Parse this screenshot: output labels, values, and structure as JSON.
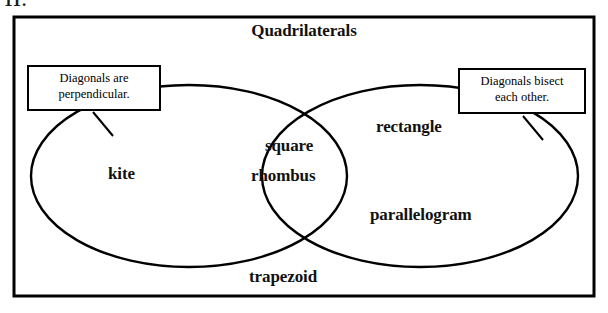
{
  "page": {
    "number_label": "11.",
    "title": "Quadrilaterals"
  },
  "diagram": {
    "type": "venn-two-set",
    "outer_set_label": "Quadrilaterals",
    "border_color": "#000000",
    "background_color": "#ffffff",
    "left_circle": {
      "name": "diagonals-are-perpendicular",
      "callout_line1": "Diagonals are",
      "callout_line2": "perpendicular.",
      "members": [
        "kite"
      ]
    },
    "right_circle": {
      "name": "diagonals-bisect-each-other",
      "callout_line1": "Diagonals bisect",
      "callout_line2": "each other.",
      "members": [
        "rectangle",
        "parallelogram"
      ]
    },
    "intersection": {
      "name": "square-rhombus-region",
      "members": [
        "square",
        "rhombus"
      ]
    },
    "outside_both": {
      "name": "trapezoid-region",
      "members": [
        "trapezoid"
      ]
    },
    "labels": {
      "kite": "kite",
      "square": "square",
      "rhombus": "rhombus",
      "rectangle": "rectangle",
      "parallelogram": "parallelogram",
      "trapezoid": "trapezoid"
    }
  }
}
